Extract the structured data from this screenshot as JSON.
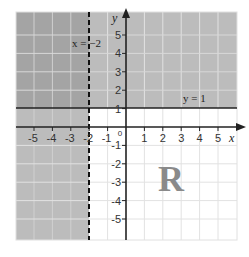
{
  "diagram": {
    "type": "inequality-region-graph",
    "x_range": [
      -5,
      5
    ],
    "y_range": [
      -5,
      5
    ],
    "axis_labels": {
      "x": "x",
      "y": "y"
    },
    "x_ticks": [
      "-5",
      "-4",
      "-3",
      "-2",
      "-1",
      "1",
      "2",
      "3",
      "4",
      "5"
    ],
    "y_ticks": [
      "5",
      "4",
      "3",
      "2",
      "1",
      "-1",
      "-2",
      "-3",
      "-4",
      "-5"
    ],
    "origin_label": "0",
    "boundary_lines": [
      {
        "label": "x = −2",
        "equation": "x = -2",
        "style": "dashed"
      },
      {
        "label": "y = 1",
        "equation": "y = 1",
        "style": "solid"
      }
    ],
    "shaded_regions": [
      {
        "description": "x < -2",
        "color": "#bcbcbc"
      },
      {
        "description": "y > 1",
        "color": "#bcbcbc"
      }
    ],
    "unshaded_region_label": "R",
    "colors": {
      "shade": "#bcbcbc",
      "overlap_shade": "#a8a8a8",
      "grid_on_shade": "#d8d8d8",
      "grid_on_white": "#e4e4e4",
      "axis": "#222222"
    }
  }
}
